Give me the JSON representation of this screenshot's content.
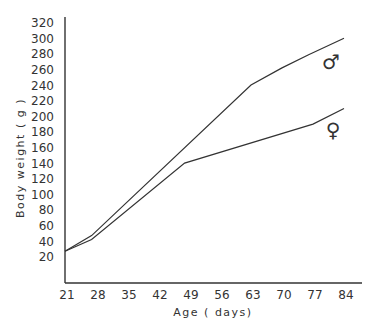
{
  "chart_data": {
    "type": "line",
    "title": "",
    "xlabel": "Age ( days)",
    "ylabel": "Body weight ( g )",
    "x_ticks": [
      21,
      28,
      35,
      42,
      49,
      56,
      63,
      70,
      77,
      84
    ],
    "y_ticks": [
      20,
      40,
      60,
      80,
      100,
      120,
      140,
      160,
      180,
      200,
      220,
      240,
      260,
      280,
      300,
      320
    ],
    "xlim": [
      21,
      88
    ],
    "ylim": [
      0,
      320
    ],
    "grid": false,
    "legend": "inline symbols at line ends",
    "series": [
      {
        "name": "Male",
        "symbol": "♂",
        "x": [
          21,
          27,
          63,
          70,
          76,
          84
        ],
        "values": [
          27,
          47,
          240,
          262,
          279,
          300
        ]
      },
      {
        "name": "Female",
        "symbol": "♀",
        "x": [
          21,
          27,
          48,
          77,
          84
        ],
        "values": [
          27,
          42,
          140,
          190,
          210
        ]
      }
    ]
  }
}
